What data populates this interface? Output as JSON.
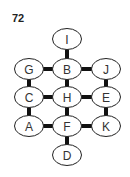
{
  "figure": {
    "number_label": "72",
    "node_size": {
      "rx": 14.5,
      "ry": 10.5
    },
    "nodes": [
      {
        "id": "I",
        "label": "I",
        "x": 67,
        "y": 39
      },
      {
        "id": "G",
        "label": "G",
        "x": 29,
        "y": 69
      },
      {
        "id": "B",
        "label": "B",
        "x": 67,
        "y": 69
      },
      {
        "id": "J",
        "label": "J",
        "x": 106,
        "y": 69
      },
      {
        "id": "C",
        "label": "C",
        "x": 29,
        "y": 97
      },
      {
        "id": "H",
        "label": "H",
        "x": 67,
        "y": 97
      },
      {
        "id": "E",
        "label": "E",
        "x": 106,
        "y": 97
      },
      {
        "id": "A",
        "label": "A",
        "x": 29,
        "y": 126
      },
      {
        "id": "F",
        "label": "F",
        "x": 67,
        "y": 126
      },
      {
        "id": "K",
        "label": "K",
        "x": 106,
        "y": 126
      },
      {
        "id": "D",
        "label": "D",
        "x": 67,
        "y": 155
      }
    ],
    "edges": [
      [
        "I",
        "B"
      ],
      [
        "G",
        "B"
      ],
      [
        "B",
        "J"
      ],
      [
        "G",
        "C"
      ],
      [
        "B",
        "H"
      ],
      [
        "J",
        "E"
      ],
      [
        "C",
        "H"
      ],
      [
        "H",
        "E"
      ],
      [
        "C",
        "A"
      ],
      [
        "H",
        "F"
      ],
      [
        "E",
        "K"
      ],
      [
        "A",
        "F"
      ],
      [
        "F",
        "K"
      ],
      [
        "F",
        "D"
      ]
    ]
  }
}
